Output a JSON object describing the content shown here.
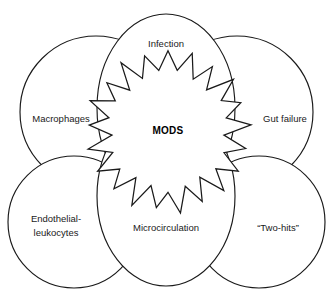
{
  "figure": {
    "type": "venn-overlap-diagram",
    "background_color": "#ffffff",
    "stroke_color": "#1a1a1a",
    "center": {
      "label": "MODS",
      "shape": "starburst",
      "points": 21
    },
    "lobes": [
      {
        "id": "infection",
        "label": "Infection",
        "label_lines": [
          "Infection"
        ],
        "shape": "ellipse",
        "position": "top-center"
      },
      {
        "id": "macrophages",
        "label": "Macrophages",
        "label_lines": [
          "Macrophages"
        ],
        "shape": "circle",
        "position": "left"
      },
      {
        "id": "gut-failure",
        "label": "Gut failure",
        "label_lines": [
          "Gut failure"
        ],
        "shape": "circle",
        "position": "right"
      },
      {
        "id": "endothelial-leukocytes",
        "label": "Endothelial-leukocytes",
        "label_lines": [
          "Endothelial-",
          "leukocytes"
        ],
        "shape": "circle",
        "position": "bottom-left"
      },
      {
        "id": "microcirculation",
        "label": "Microcirculation",
        "label_lines": [
          "Microcirculation"
        ],
        "shape": "ellipse",
        "position": "bottom-center"
      },
      {
        "id": "two-hits",
        "label": "“Two-hits”",
        "label_lines": [
          "“Two-hits”"
        ],
        "shape": "circle",
        "position": "bottom-right"
      }
    ]
  }
}
